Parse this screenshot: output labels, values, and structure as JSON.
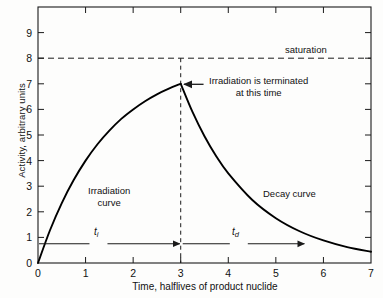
{
  "figure": {
    "background_color": "#fdfdfc",
    "line_color": "#000000",
    "axis_color": "#1a1a1a"
  },
  "chart_data": {
    "type": "line",
    "title": "",
    "xlabel": "Time, halflives of product nuclide",
    "ylabel": "Activity, arbitrary units",
    "xlim": [
      0,
      7
    ],
    "ylim": [
      0,
      10
    ],
    "xticks": [
      "0",
      "1",
      "2",
      "3",
      "4",
      "5",
      "6",
      "7"
    ],
    "xtick_values": [
      0,
      1,
      2,
      3,
      4,
      5,
      6,
      7
    ],
    "yticks": [
      "0",
      "1",
      "2",
      "3",
      "4",
      "5",
      "6",
      "7",
      "8",
      "9"
    ],
    "ytick_values": [
      0,
      1,
      2,
      3,
      4,
      5,
      6,
      7,
      8,
      9
    ],
    "grid": false,
    "legend": "none",
    "saturation_level": 8,
    "termination_time": 3,
    "peak_activity": 7,
    "series": [
      {
        "name": "Irradiation curve",
        "formula": "A = 8 * (1 - 2^(-t))",
        "x": [
          0,
          0.25,
          0.5,
          0.75,
          1.0,
          1.25,
          1.5,
          1.75,
          2.0,
          2.25,
          2.5,
          2.75,
          3.0
        ],
        "values": [
          0.0,
          1.27,
          2.34,
          3.24,
          4.0,
          4.64,
          5.17,
          5.63,
          6.0,
          6.32,
          6.59,
          6.81,
          7.0
        ]
      },
      {
        "name": "Decay curve",
        "formula": "A = 7 * 2^(-(t-3))",
        "x": [
          3.0,
          3.25,
          3.5,
          3.75,
          4.0,
          4.5,
          5.0,
          5.5,
          6.0,
          6.5,
          7.0
        ],
        "values": [
          7.0,
          5.89,
          4.95,
          4.16,
          3.5,
          2.47,
          1.75,
          1.24,
          0.88,
          0.62,
          0.44
        ]
      }
    ],
    "annotations": [
      {
        "key": "saturation",
        "text": "saturation",
        "x": 6.0,
        "y": 8.3
      },
      {
        "key": "terminated",
        "line1": "Irradiation is terminated",
        "line2": "at this time",
        "x": 3.2,
        "y": 7.1
      },
      {
        "key": "irradiation_curve",
        "line1": "Irradiation",
        "line2": "curve",
        "x": 1.3,
        "y": 2.6
      },
      {
        "key": "decay_curve",
        "text": "Decay curve",
        "x": 4.8,
        "y": 2.5
      },
      {
        "key": "t_i",
        "text": "t",
        "subscript": "i",
        "x": 1.25,
        "y": 0.75
      },
      {
        "key": "t_d",
        "text": "t",
        "subscript": "d",
        "x": 4.2,
        "y": 0.75
      }
    ]
  },
  "axis_labels": {
    "y": "Activity, arbitrary units",
    "x": "Time, halflives of product nuclide"
  },
  "annotations": {
    "saturation": "saturation",
    "terminated_line1": "Irradiation is terminated",
    "terminated_line2": "at this time",
    "irradiation_line1": "Irradiation",
    "irradiation_line2": "curve",
    "decay": "Decay curve",
    "t_i_base": "t",
    "t_i_sub": "i",
    "t_d_base": "t",
    "t_d_sub": "d"
  }
}
